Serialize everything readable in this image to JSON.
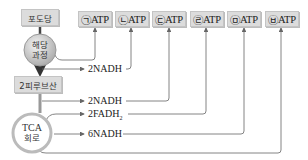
{
  "diagram": {
    "glucose": "포도당",
    "glycolysis": {
      "line1": "해당",
      "line2": "과정"
    },
    "pyruvate": "2피루브산",
    "tca": {
      "line1": "TCA",
      "line2": "회로"
    },
    "atp_boxes": [
      {
        "mark": "㉠",
        "label": "ATP"
      },
      {
        "mark": "㉡",
        "label": "ATP"
      },
      {
        "mark": "㉢",
        "label": "ATP"
      },
      {
        "mark": "㉣",
        "label": "ATP"
      },
      {
        "mark": "㉤",
        "label": "ATP"
      },
      {
        "mark": "㉥",
        "label": "ATP"
      }
    ],
    "carriers": {
      "glycolysis_nadh": "2NADH",
      "pyruvate_nadh": "2NADH",
      "tca_fadh2": "2FADH",
      "tca_fadh2_sub": "2",
      "tca_nadh": "6NADH"
    },
    "colors": {
      "box_fill": "#dcdcdc",
      "line": "#666666",
      "arrow_main": "#555555"
    }
  }
}
